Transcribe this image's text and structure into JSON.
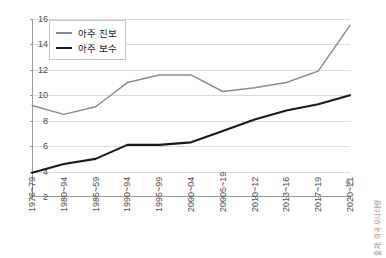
{
  "chart_data": {
    "type": "line",
    "title": "",
    "xlabel": "년",
    "ylabel": "",
    "ylim": [
      2,
      16
    ],
    "ytick_step": 2,
    "yticks": [
      2,
      4,
      6,
      8,
      10,
      12,
      14,
      16
    ],
    "grid": true,
    "legend_position": "top-left",
    "categories": [
      "1976~79",
      "1980~94",
      "1985~59",
      "1990~94",
      "1995~99",
      "2000~04",
      "20005~19",
      "2010~12",
      "2013~16",
      "2017~19",
      "2020~21"
    ],
    "series": [
      {
        "name": "아주 진보",
        "color": "#8c8c8c",
        "values": [
          9.2,
          8.5,
          9.1,
          11.0,
          11.6,
          11.6,
          10.3,
          10.6,
          11.0,
          11.9,
          15.5
        ]
      },
      {
        "name": "아주 보수",
        "color": "#1a1a1a",
        "values": [
          3.9,
          4.6,
          5.0,
          6.1,
          6.1,
          6.3,
          7.2,
          8.1,
          8.8,
          9.3,
          10.0
        ]
      }
    ],
    "annotations": {
      "source_note": "출처: 미국 모니터링"
    }
  },
  "legend": {
    "items": [
      {
        "label": "아주 진보"
      },
      {
        "label": "아주 보수"
      }
    ]
  }
}
